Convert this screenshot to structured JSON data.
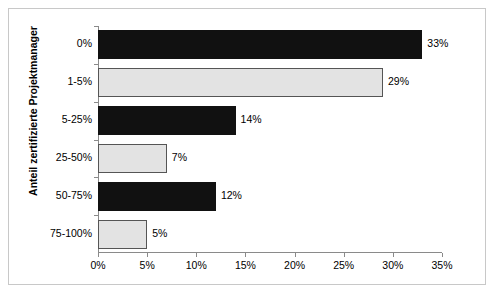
{
  "chart_data": {
    "type": "bar",
    "orientation": "horizontal",
    "title": "",
    "xlabel": "",
    "ylabel": "Anteil zertifizierte Projektmanager",
    "categories": [
      "0%",
      "1-5%",
      "5-25%",
      "25-50%",
      "50-75%",
      "75-100%"
    ],
    "values": [
      33,
      29,
      14,
      7,
      12,
      5
    ],
    "value_labels": [
      "33%",
      "29%",
      "14%",
      "7%",
      "12%",
      "5%"
    ],
    "bar_colors": [
      "#111111",
      "#e3e3e3",
      "#111111",
      "#e3e3e3",
      "#111111",
      "#e3e3e3"
    ],
    "xlim": [
      0,
      35
    ],
    "xticks": [
      0,
      5,
      10,
      15,
      20,
      25,
      30,
      35
    ],
    "xtick_labels": [
      "0%",
      "5%",
      "10%",
      "15%",
      "20%",
      "25%",
      "30%",
      "35%"
    ],
    "grid": false,
    "legend": null,
    "frame_color": "#c8c8c8",
    "axis_color": "#8a8a8a"
  }
}
